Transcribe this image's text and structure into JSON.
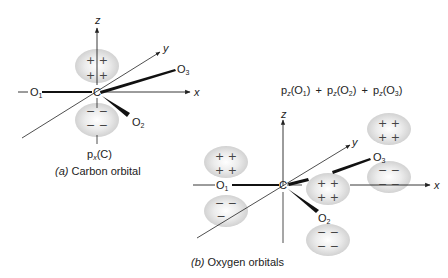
{
  "diagram_a": {
    "caption_prefix": "(a)",
    "caption": "Carbon orbital",
    "orbital_label_base": "p",
    "orbital_label_sub": "x",
    "orbital_label_arg": "(C)",
    "center_atom": "C",
    "axis_labels": {
      "x": "x",
      "y": "y",
      "z": "z"
    },
    "atoms": [
      {
        "name": "O",
        "sub": "1"
      },
      {
        "name": "O",
        "sub": "2"
      },
      {
        "name": "O",
        "sub": "3"
      }
    ],
    "lobes": {
      "upper": "+ +",
      "lower": "− −"
    }
  },
  "diagram_b": {
    "caption_prefix": "(b)",
    "caption": "Oxygen orbitals",
    "expression": [
      {
        "base": "p",
        "sub": "z",
        "arg": "(O",
        "argsub": "1",
        "close": ")"
      },
      {
        "base": "p",
        "sub": "z",
        "arg": "(O",
        "argsub": "2",
        "close": ")"
      },
      {
        "base": "p",
        "sub": "z",
        "arg": "(O",
        "argsub": "3",
        "close": ")"
      }
    ],
    "plus": "+",
    "center_atom": "C",
    "axis_labels": {
      "x": "x",
      "y": "y",
      "z": "z"
    },
    "atoms": [
      {
        "name": "O",
        "sub": "1"
      },
      {
        "name": "O",
        "sub": "2"
      },
      {
        "name": "O",
        "sub": "3"
      }
    ],
    "lobes": {
      "plus": "+ +",
      "minus": "− −"
    }
  },
  "colors": {
    "lobe_fill": "#e4e4e4",
    "line": "#222222"
  }
}
